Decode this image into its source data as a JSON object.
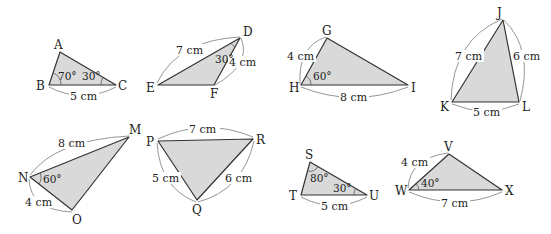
{
  "figure": {
    "fill_color": "#d9d9d9",
    "stroke_color": "#333333"
  },
  "triangles": [
    {
      "name": "ABC",
      "vertices": {
        "A": "A",
        "B": "B",
        "C": "C"
      },
      "measures": {
        "side_bc": "5 cm",
        "angle_b": "70°",
        "angle_c": "30°"
      }
    },
    {
      "name": "DEF",
      "vertices": {
        "D": "D",
        "E": "E",
        "F": "F"
      },
      "measures": {
        "side_de": "7 cm",
        "side_df": "4 cm",
        "angle_d": "30°"
      }
    },
    {
      "name": "GHI",
      "vertices": {
        "G": "G",
        "H": "H",
        "I": "I"
      },
      "measures": {
        "side_gh": "4 cm",
        "side_hi": "8 cm",
        "angle_h": "60°"
      }
    },
    {
      "name": "JKL",
      "vertices": {
        "J": "J",
        "K": "K",
        "L": "L"
      },
      "measures": {
        "side_jk": "7 cm",
        "side_jl": "6 cm",
        "side_kl": "5 cm"
      }
    },
    {
      "name": "MNO",
      "vertices": {
        "M": "M",
        "N": "N",
        "O": "O"
      },
      "measures": {
        "side_mn": "8 cm",
        "side_no": "4 cm",
        "angle_n": "60°"
      }
    },
    {
      "name": "PQR",
      "vertices": {
        "P": "P",
        "Q": "Q",
        "R": "R"
      },
      "measures": {
        "side_pr": "7 cm",
        "side_pq": "5 cm",
        "side_qr": "6 cm"
      }
    },
    {
      "name": "STU",
      "vertices": {
        "S": "S",
        "T": "T",
        "U": "U"
      },
      "measures": {
        "side_tu": "5 cm",
        "angle_s": "80°",
        "angle_u": "30°"
      }
    },
    {
      "name": "VWX",
      "vertices": {
        "V": "V",
        "W": "W",
        "X": "X"
      },
      "measures": {
        "side_vw": "4 cm",
        "side_wx": "7 cm",
        "angle_w": "40°"
      }
    }
  ]
}
